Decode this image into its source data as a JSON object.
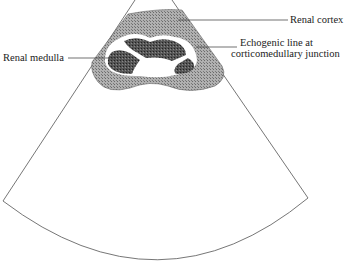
{
  "diagram": {
    "type": "ultrasound-sector-schematic",
    "labels": {
      "cortex": "Renal cortex",
      "medulla": "Renal medulla",
      "echogenic_line_1": "Echogenic line at",
      "echogenic_line_2": "corticomedullary junction"
    },
    "colors": {
      "outline": "#555555",
      "cortex_fill": "#9a9a9a",
      "medulla_fill": "#4a4a4a",
      "echogenic_line": "#ffffff",
      "leader_line": "#333333"
    }
  }
}
